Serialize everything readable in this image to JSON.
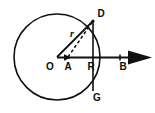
{
  "figure": {
    "type": "geometry-diagram",
    "background_color": "#ffffff",
    "stroke_color": "#111111",
    "labels": {
      "center": "O",
      "interior_point": "A",
      "axis_intersection": "R",
      "arrow_end": "B",
      "upper_point": "D",
      "lower_point": "G",
      "radius": "r"
    },
    "geometry": {
      "circle": {
        "cx": 57,
        "cy": 57,
        "r": 43
      },
      "points": {
        "O": {
          "x": 57,
          "y": 57
        },
        "A": {
          "x": 68,
          "y": 57
        },
        "R": {
          "x": 93,
          "y": 57
        },
        "B": {
          "x": 125,
          "y": 57
        },
        "D": {
          "x": 93,
          "y": 21
        },
        "G": {
          "x": 93,
          "y": 91
        }
      },
      "segments": [
        {
          "name": "radius-OD",
          "from": "O",
          "to": "D",
          "style": "solid",
          "label": "r"
        },
        {
          "name": "chord-AD",
          "from": "A",
          "to": "D",
          "style": "dashed"
        },
        {
          "name": "chord-DG",
          "from": "D",
          "to": "G",
          "style": "solid"
        },
        {
          "name": "axis-OB",
          "from": "O",
          "to": "B",
          "style": "solid-arrow"
        }
      ]
    }
  }
}
